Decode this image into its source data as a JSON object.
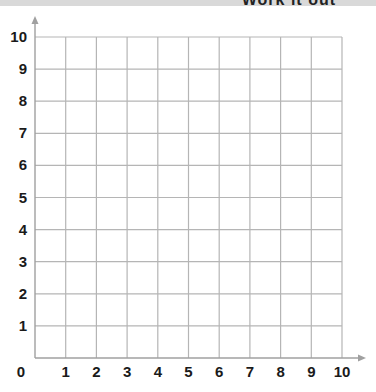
{
  "heading": {
    "text": "Work it out"
  },
  "chart_data": {
    "type": "scatter",
    "title": "",
    "xlabel": "",
    "ylabel": "",
    "xlim": [
      0,
      10
    ],
    "ylim": [
      0,
      10
    ],
    "x_ticks": [
      "0",
      "1",
      "2",
      "3",
      "4",
      "5",
      "6",
      "7",
      "8",
      "9",
      "10"
    ],
    "y_ticks": [
      "1",
      "2",
      "3",
      "4",
      "5",
      "6",
      "7",
      "8",
      "9",
      "10"
    ],
    "grid": true,
    "series": [],
    "colors": {
      "grid": "#b5b5b5",
      "axis": "#a0a0a0",
      "labels": "#1a1a1a"
    }
  }
}
